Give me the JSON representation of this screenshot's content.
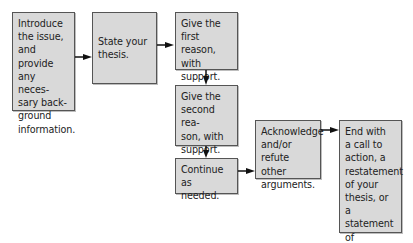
{
  "diagram": {
    "type": "flowchart",
    "colors": {
      "box_fill": "#d9d9d9",
      "box_border": "#555555",
      "arrow": "#111111",
      "text": "#222222"
    },
    "steps": [
      {
        "id": "intro",
        "text": "Introduce\nthe issue,\nand provide\nany neces-\nsary back-\nground\ninformation."
      },
      {
        "id": "thesis",
        "text": "State your\nthesis."
      },
      {
        "id": "reason1",
        "text": "Give the\nfirst reason,\nwith\nsupport."
      },
      {
        "id": "reason2",
        "text": "Give the\nsecond rea-\nson, with\nsupport."
      },
      {
        "id": "continue",
        "text": "Continue as\nneeded."
      },
      {
        "id": "acknowledge",
        "text": "Acknowledge\nand/or\nrefute other\narguments."
      },
      {
        "id": "end",
        "text": "End with\na call to\naction, a\nrestatement\nof your\nthesis, or a\nstatement of\nimplications."
      }
    ],
    "connections": [
      {
        "from": "intro",
        "to": "thesis",
        "direction": "right"
      },
      {
        "from": "thesis",
        "to": "reason1",
        "direction": "right"
      },
      {
        "from": "reason1",
        "to": "reason2",
        "direction": "down"
      },
      {
        "from": "reason2",
        "to": "continue",
        "direction": "down"
      },
      {
        "from": "continue",
        "to": "acknowledge",
        "direction": "right"
      },
      {
        "from": "acknowledge",
        "to": "end",
        "direction": "right"
      }
    ]
  }
}
